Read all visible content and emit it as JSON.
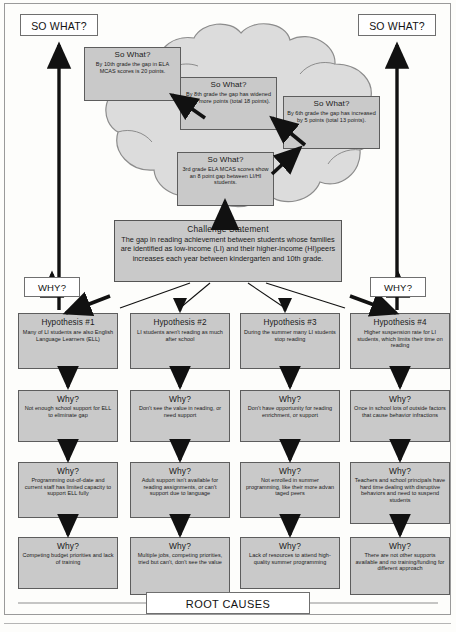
{
  "banners": {
    "so_what_left": "SO WHAT?",
    "so_what_right": "SO WHAT?",
    "why_left": "WHY?",
    "why_right": "WHY?",
    "root_causes": "ROOT CAUSES"
  },
  "so_what_boxes": [
    {
      "title": "So What?",
      "body": "By 10th grade the gap in ELA MCAS scores is 20 points."
    },
    {
      "title": "So What?",
      "body": "By 8th grade the gap has widened by 5 more points (total 18 points)."
    },
    {
      "title": "So What?",
      "body": "By 6th grade the gap has increased by 5 points (total 13 points)."
    },
    {
      "title": "So What?",
      "body": "3rd grade ELA MCAS scores show an 8 point gap between LI/HI students."
    }
  ],
  "challenge": {
    "title": "Challenge  Statement",
    "body": "The gap in reading achievement between students whose families are identified as low-income (LI) and their higher-income (HI)peers increases each year between kindergarten and 10th grade."
  },
  "columns": [
    {
      "hypothesis": {
        "title": "Hypothesis #1",
        "body": "Many of LI students are also English Language Learners (ELL)"
      },
      "whys": [
        {
          "title": "Why?",
          "body": "Not enough school support for ELL to eliminate gap"
        },
        {
          "title": "Why?",
          "body": "Programming out-of-date and current staff has limited capacity to support ELL fully"
        },
        {
          "title": "Why?",
          "body": "Competing budget priorities and lack of training"
        }
      ]
    },
    {
      "hypothesis": {
        "title": "Hypothesis #2",
        "body": "LI students aren't reading as much after school"
      },
      "whys": [
        {
          "title": "Why?",
          "body": "Don't see the value in reading, or need support"
        },
        {
          "title": "Why?",
          "body": "Adult support isn't available for reading assignments, or can't support due to language"
        },
        {
          "title": "Why?",
          "body": "Multiple jobs, competing priorities, tried but can't, don't see the value"
        }
      ]
    },
    {
      "hypothesis": {
        "title": "Hypothesis #3",
        "body": "During the summer many LI students stop reading"
      },
      "whys": [
        {
          "title": "Why?",
          "body": "Don't have opportunity for reading enrichment, or support"
        },
        {
          "title": "Why?",
          "body": "Not enrolled in summer programming, like their more advan taged peers"
        },
        {
          "title": "Why?",
          "body": "Lack of resources to attend high-quality summer programming"
        }
      ]
    },
    {
      "hypothesis": {
        "title": "Hypothesis #4",
        "body": "Higher suspension rate for LI students, which limits their time on reading"
      },
      "whys": [
        {
          "title": "Why?",
          "body": "Once in school lots of outside factors that cause behavior infractions"
        },
        {
          "title": "Why?",
          "body": "Teachers and school principals have hard time dealing with disruptive behaviors and need to suspend students"
        },
        {
          "title": "Why?",
          "body": "There are not other supports available and no training/funding for different approach"
        }
      ]
    }
  ],
  "colors": {
    "box_fill": "#c9c9c9",
    "box_stroke": "#5d5d5d",
    "cloud_fill": "#dcdcdc",
    "cloud_stroke": "#8c8c8c",
    "arrow": "#111111",
    "frame": "#9a9a9a"
  }
}
